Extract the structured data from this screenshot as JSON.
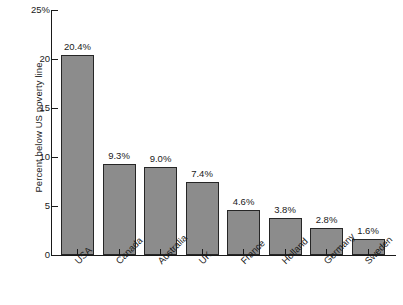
{
  "chart_data": {
    "type": "bar",
    "title": "",
    "xlabel": "",
    "ylabel": "Percent below US poverty line",
    "ylim": [
      0,
      25
    ],
    "yticks": [
      0,
      5,
      10,
      15,
      20,
      25
    ],
    "ytick_labels": [
      "0",
      "5",
      "10",
      "15",
      "20",
      "25%"
    ],
    "grid": false,
    "legend": null,
    "categories": [
      "USA",
      "Canada",
      "Australia",
      "UK",
      "France",
      "Holland",
      "Germany",
      "Sweden"
    ],
    "values": [
      20.4,
      9.3,
      9.0,
      7.4,
      4.6,
      3.8,
      2.8,
      1.6
    ],
    "value_labels": [
      "20.4%",
      "9.3%",
      "9.0%",
      "7.4%",
      "4.6%",
      "3.8%",
      "2.8%",
      "1.6%"
    ],
    "bar_color": "#8c8c8c",
    "bar_edge_color": "#262626",
    "axis_color": "#1a1a1a"
  }
}
